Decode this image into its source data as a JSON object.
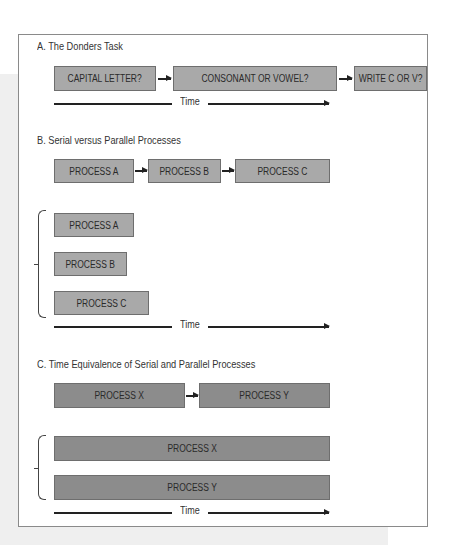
{
  "section_a": {
    "title": "A. The Donders Task",
    "steps": [
      "CAPITAL LETTER?",
      "CONSONANT OR VOWEL?",
      "WRITE C OR V?"
    ],
    "time_label": "Time"
  },
  "section_b": {
    "title": "B. Serial versus Parallel Processes",
    "serial": [
      "PROCESS A",
      "PROCESS B",
      "PROCESS C"
    ],
    "parallel": [
      "PROCESS A",
      "PROCESS B",
      "PROCESS C"
    ],
    "time_label": "Time"
  },
  "section_c": {
    "title": "C. Time Equivalence of Serial and Parallel Processes",
    "serial": [
      "PROCESS X",
      "PROCESS Y"
    ],
    "parallel": [
      "PROCESS X",
      "PROCESS Y"
    ],
    "time_label": "Time"
  },
  "colors": {
    "light_box": "#a9a9a9",
    "dark_box": "#8c8c8c",
    "frame": "#8a8a8a"
  }
}
